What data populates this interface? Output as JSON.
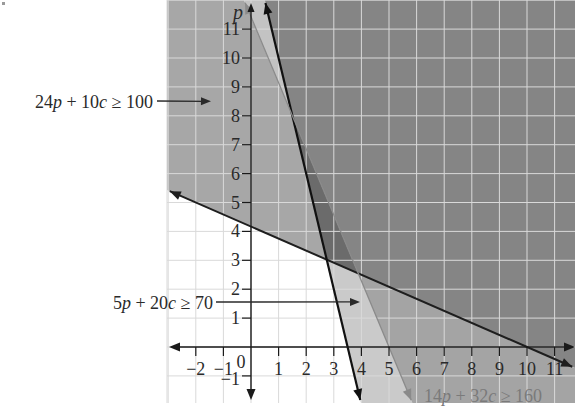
{
  "chart_data": {
    "type": "area",
    "subtype": "linear-inequality-feasible-regions",
    "title": "",
    "xlabel": "",
    "ylabel": "p",
    "origin_label": "0",
    "xlim": [
      -3,
      11.7
    ],
    "ylim": [
      -1.9,
      12
    ],
    "grid": true,
    "x_ticks": [
      -2,
      -1,
      1,
      2,
      3,
      4,
      5,
      6,
      7,
      8,
      9,
      10,
      11
    ],
    "y_ticks": [
      -1,
      1,
      2,
      3,
      4,
      5,
      6,
      7,
      8,
      9,
      10,
      11
    ],
    "inequalities": [
      {
        "label": "24p + 10c ≥ 100",
        "coef_p": 24,
        "coef_c": 10,
        "rhs": 100,
        "c_intercept": 10,
        "p_intercept": 4.17,
        "line_color": "#1e1e1e",
        "line_width": 2
      },
      {
        "label": "5p + 20c ≥ 70",
        "coef_p": 5,
        "coef_c": 20,
        "rhs": 70,
        "c_intercept": 3.5,
        "p_intercept": 14,
        "line_color": "#111111",
        "line_width": 2.2
      },
      {
        "label": "14p + 32c ≥ 160",
        "coef_p": 14,
        "coef_c": 32,
        "rhs": 160,
        "c_intercept": 5,
        "p_intercept": 11.43,
        "line_color": "#8a8a8a",
        "line_width": 1.3
      }
    ],
    "intersections": [
      {
        "lines": [
          "24p + 10c = 100",
          "5p + 20c = 70"
        ],
        "c": 2.74,
        "p": 3.02
      },
      {
        "lines": [
          "24p + 10c = 100",
          "14p + 32c = 160"
        ],
        "c": 3.89,
        "p": 2.55
      },
      {
        "lines": [
          "5p + 20c = 70",
          "14p + 32c = 160"
        ],
        "c": 1.5,
        "p": 8
      }
    ],
    "regions": [
      {
        "satisfies": [
          false,
          false,
          false
        ],
        "color": "#ffffff"
      },
      {
        "satisfies": [
          true,
          false,
          false
        ],
        "color": "#a7a7a7"
      },
      {
        "satisfies": [
          true,
          false,
          true
        ],
        "color": "#c3c3c3"
      },
      {
        "satisfies": [
          true,
          true,
          false
        ],
        "color": "#6b6b6b"
      },
      {
        "satisfies": [
          true,
          true,
          true
        ],
        "color": "#858585"
      },
      {
        "satisfies": [
          false,
          true,
          false
        ],
        "color": "#cacaca"
      },
      {
        "satisfies": [
          false,
          true,
          true
        ],
        "color": "#a4a4a4"
      },
      {
        "satisfies": [
          false,
          false,
          true
        ],
        "color": "#c3c3c3"
      }
    ],
    "annotations": [
      {
        "text": "24p + 10c ≥ 100",
        "for": 0,
        "arrow_to": [
          -1.45,
          8.5
        ],
        "color": "#2a2a2a"
      },
      {
        "text": "5p + 20c ≥ 70",
        "for": 1,
        "arrow_to": [
          3.95,
          1.56
        ],
        "color": "#2a2a2a"
      },
      {
        "text": "14p + 32c ≥ 160",
        "for": 2,
        "arrow_to": null,
        "color": "#7a7a7a"
      }
    ],
    "colors": {
      "axis": "#1a1a1a",
      "grid": "#d9d9d9",
      "tick_label": "#2a2a2a",
      "background": "#ffffff"
    }
  }
}
